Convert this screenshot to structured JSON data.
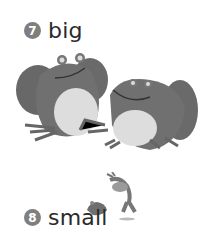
{
  "items": [
    {
      "number": "7",
      "word": "big",
      "illustration": "two-large-frogs"
    },
    {
      "number": "8",
      "word": "small",
      "illustration": "two-small-frogs"
    }
  ],
  "colors": {
    "badge": "#7f7f7f",
    "text": "#2a2a2a",
    "frog_body": "#6f6f6f",
    "frog_belly": "#dcdcdc"
  }
}
